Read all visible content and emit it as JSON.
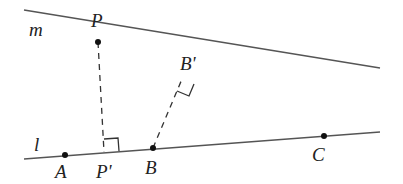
{
  "diagram": {
    "lines": [
      {
        "name": "m",
        "label": "m",
        "x1": 24,
        "y1": 10,
        "x2": 380,
        "y2": 68
      },
      {
        "name": "l",
        "label": "l",
        "x1": 24,
        "y1": 159,
        "x2": 380,
        "y2": 132
      }
    ],
    "points": [
      {
        "name": "P",
        "label": "P",
        "x": 98,
        "y": 42
      },
      {
        "name": "P-prime",
        "label": "P'",
        "x": 104,
        "y": 152
      },
      {
        "name": "A",
        "label": "A",
        "x": 65,
        "y": 155
      },
      {
        "name": "B",
        "label": "B",
        "x": 153,
        "y": 148
      },
      {
        "name": "B-prime",
        "label": "B'",
        "x": 182,
        "y": 79
      },
      {
        "name": "C",
        "label": "C",
        "x": 324,
        "y": 136
      }
    ],
    "segments": [
      {
        "name": "PP-prime",
        "from": "P",
        "to": "P'",
        "style": "dashed"
      },
      {
        "name": "BB-prime",
        "from": "B",
        "to": "B'",
        "style": "dashed"
      }
    ],
    "right_angles": [
      "P'",
      "B'"
    ],
    "colors": {
      "line": "#555555",
      "point": "#111111",
      "text": "#222222"
    }
  }
}
